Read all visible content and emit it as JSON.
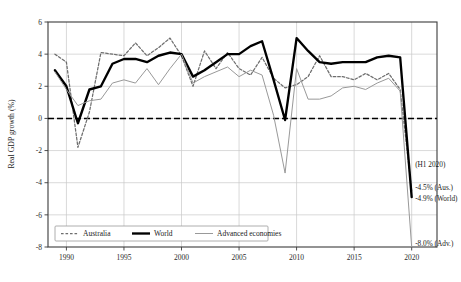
{
  "chart_data": {
    "type": "line",
    "title": "",
    "xlabel": "",
    "ylabel": "Real GDP growth (%)",
    "xlim": [
      1988.4,
      2022.2
    ],
    "ylim": [
      -8,
      6
    ],
    "yticks": [
      6,
      4,
      2,
      0,
      -2,
      -4,
      -6,
      -8
    ],
    "xticks": [
      1990,
      1995,
      2000,
      2005,
      2010,
      2015,
      2020
    ],
    "ytick_labels": [
      "6",
      "4",
      "2",
      "0",
      "-2",
      "-4",
      "-6",
      "-8"
    ],
    "xtick_labels": [
      "1990",
      "1995",
      "2000",
      "2005",
      "2010",
      "2015",
      "2020"
    ],
    "grid": true,
    "zero_line": true,
    "legend_position": "bottom-left",
    "x": [
      1989,
      1990,
      1991,
      1992,
      1993,
      1994,
      1995,
      1996,
      1997,
      1998,
      1999,
      2000,
      2001,
      2002,
      2003,
      2004,
      2005,
      2006,
      2007,
      2008,
      2009,
      2010,
      2011,
      2012,
      2013,
      2014,
      2015,
      2016,
      2017,
      2018,
      2019,
      2020
    ],
    "series": [
      {
        "name": "Australia",
        "style": "dashed",
        "color": "#6e6e6e",
        "values": [
          4.0,
          3.5,
          -1.8,
          0.4,
          4.1,
          4.0,
          3.9,
          4.7,
          3.9,
          4.4,
          5.0,
          3.9,
          2.0,
          4.2,
          3.1,
          4.1,
          3.1,
          2.7,
          3.8,
          2.5,
          1.9,
          2.1,
          2.6,
          3.9,
          2.6,
          2.6,
          2.4,
          2.8,
          2.4,
          2.8,
          1.8,
          -4.5
        ]
      },
      {
        "name": "World",
        "style": "solid-thick",
        "color": "#000000",
        "values": [
          3.0,
          2.0,
          -0.3,
          1.8,
          2.0,
          3.4,
          3.7,
          3.7,
          3.5,
          3.9,
          4.1,
          4.0,
          2.6,
          3.0,
          3.5,
          4.0,
          4.0,
          4.5,
          4.8,
          2.4,
          -0.1,
          5.0,
          4.2,
          3.5,
          3.4,
          3.5,
          3.5,
          3.5,
          3.8,
          3.9,
          3.8,
          -4.9
        ]
      },
      {
        "name": "Advanced economies",
        "style": "solid-thin",
        "color": "#999999",
        "values": [
          2.9,
          1.8,
          0.8,
          1.1,
          1.2,
          2.2,
          2.4,
          2.2,
          3.1,
          2.1,
          3.1,
          4.0,
          2.2,
          2.6,
          2.9,
          3.2,
          2.6,
          3.0,
          2.7,
          0.2,
          -3.4,
          3.1,
          1.2,
          1.2,
          1.4,
          1.9,
          2.0,
          1.8,
          2.2,
          2.5,
          1.7,
          -8.0
        ]
      }
    ],
    "annotations": [
      {
        "id": "h1-2020",
        "text": "(H1 2020)",
        "x": 2020.3,
        "y": -3.05
      },
      {
        "id": "aus-2020",
        "text": "-4.5% (Aus.)",
        "x": 2020.3,
        "y": -4.45
      },
      {
        "id": "world-2020",
        "text": "-4.9% (World)",
        "x": 2020.3,
        "y": -5.15
      },
      {
        "id": "adv-2020",
        "text": "-8.0% (Adv.)",
        "x": 2020.3,
        "y": -7.92
      }
    ]
  },
  "legend": {
    "items": [
      {
        "label": "Australia",
        "style": "dashed"
      },
      {
        "label": "World",
        "style": "solid-thick"
      },
      {
        "label": "Advanced economies",
        "style": "solid-thin"
      }
    ]
  },
  "colors": {
    "world": "#000000",
    "australia": "#6e6e6e",
    "advanced": "#999999",
    "grid": "#c9c9c9",
    "axis": "#3b3b3b",
    "background": "#ffffff"
  }
}
